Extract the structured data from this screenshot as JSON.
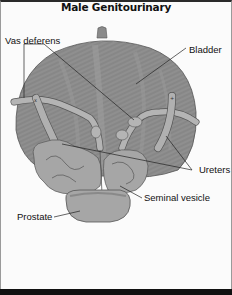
{
  "title": "Male Genitourinary",
  "labels": {
    "vas_deferens": "Vas deferens",
    "bladder": "Bladder",
    "ureters": "Ureters",
    "seminal_vesicle": "Seminal  vesicle",
    "prostate": "Prostate"
  },
  "colors": {
    "bladder_fill": "#8e8e8e",
    "bladder_stroke": "#555555",
    "organ_light": "#b4b4b4",
    "organ_mid": "#a2a2a2",
    "leader_line": "#222222",
    "bottom_bar": "#111111"
  }
}
